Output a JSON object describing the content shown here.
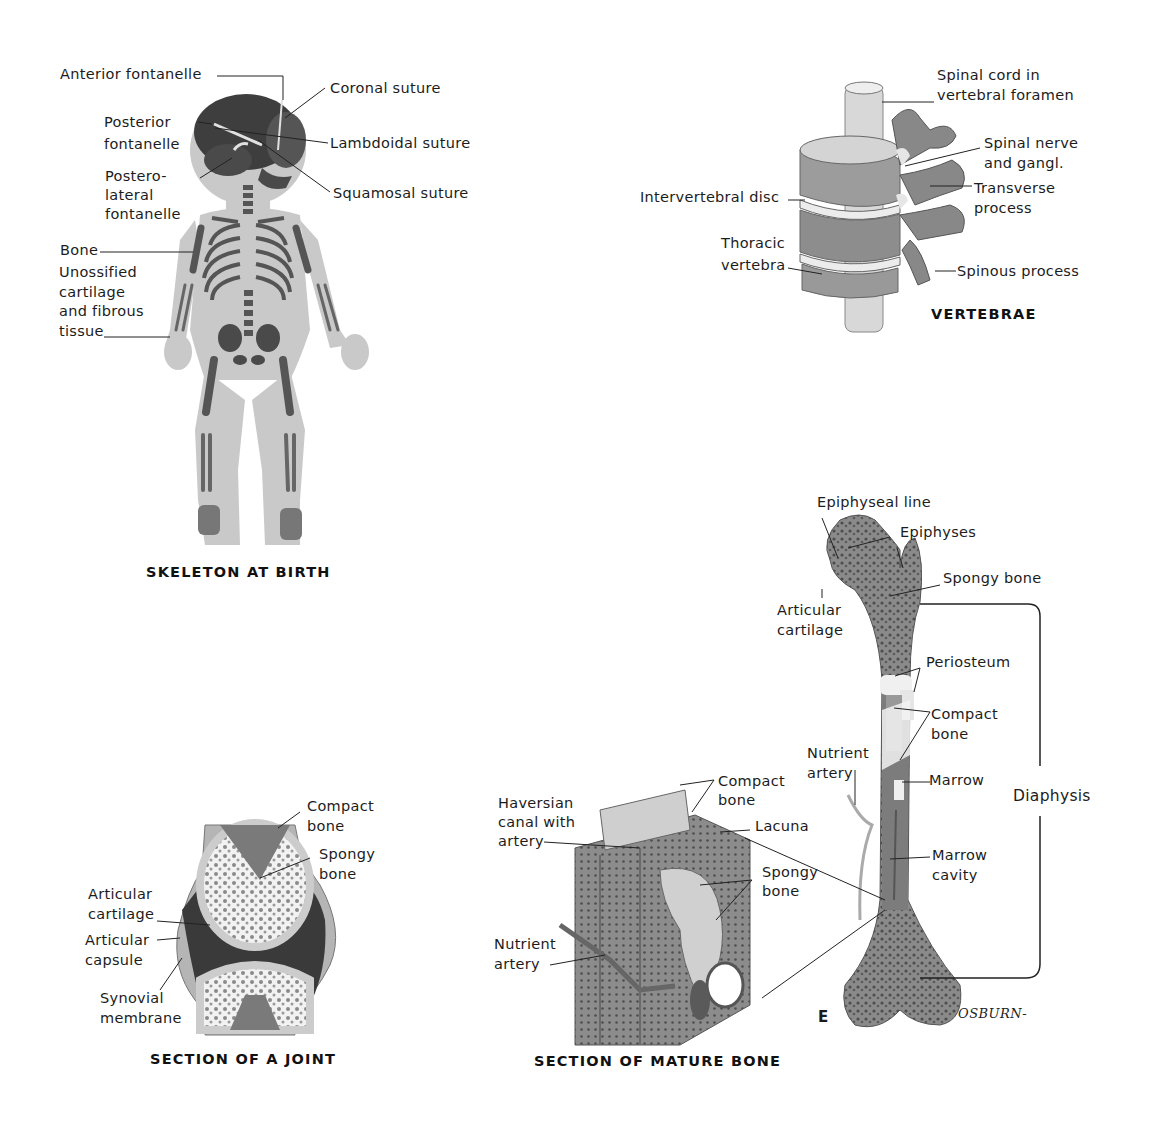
{
  "figure": {
    "panel_letter": "E",
    "signature": "OSBURN-"
  },
  "skeleton_at_birth": {
    "title": "SKELETON AT BIRTH",
    "labels": {
      "anterior_fontanelle": "Anterior fontanelle",
      "posterior_fontanelle": "Posterior\nfontanelle",
      "posterolateral_fontanelle": "Postero-\nlateral\nfontanelle",
      "bone": "Bone",
      "unossified": "Unossified\ncartilage\nand fibrous\ntissue",
      "coronal_suture": "Coronal suture",
      "lambdoidal_suture": "Lambdoidal suture",
      "squamosal_suture": "Squamosal suture"
    }
  },
  "vertebrae": {
    "title": "VERTEBRAE",
    "labels": {
      "spinal_cord": "Spinal cord in\nvertebral foramen",
      "spinal_nerve": "Spinal nerve\nand gangl.",
      "transverse_process": "Transverse\nprocess",
      "spinous_process": "Spinous process",
      "intervertebral_disc": "Intervertebral disc",
      "thoracic_vertebra": "Thoracic\nvertebra"
    }
  },
  "long_bone": {
    "labels": {
      "epiphyseal_line": "Epiphyseal line",
      "epiphyses": "Epiphyses",
      "spongy_bone": "Spongy bone",
      "articular_cartilage": "Articular\ncartilage",
      "periosteum": "Periosteum",
      "compact_bone": "Compact\nbone",
      "nutrient_artery": "Nutrient\nartery",
      "marrow": "Marrow",
      "marrow_cavity": "Marrow\ncavity",
      "diaphysis": "Diaphysis"
    }
  },
  "section_of_joint": {
    "title": "SECTION OF A JOINT",
    "labels": {
      "compact_bone": "Compact\nbone",
      "spongy_bone": "Spongy\nbone",
      "articular_cartilage": "Articular\ncartilage",
      "articular_capsule": "Articular\ncapsule",
      "synovial_membrane": "Synovial\nmembrane"
    }
  },
  "section_of_mature_bone": {
    "title": "SECTION OF MATURE BONE",
    "labels": {
      "haversian_canal": "Haversian\ncanal with\nartery",
      "compact_bone": "Compact\nbone",
      "lacuna": "Lacuna",
      "spongy_bone": "Spongy\nbone",
      "nutrient_artery": "Nutrient\nartery"
    }
  }
}
